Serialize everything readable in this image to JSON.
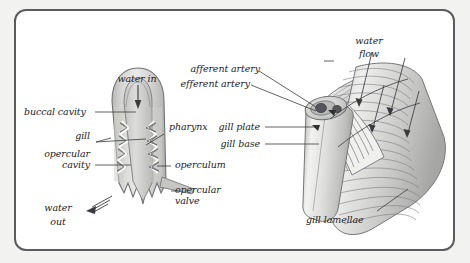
{
  "figure": {
    "background_color": "#f2f2f0",
    "panel_color": "#ffffff",
    "border_color": "#595b5e",
    "label_color": "#222326",
    "tissue_fill_light": "#e3e3e1",
    "tissue_fill_mid": "#c9c9c7",
    "tissue_fill_dark": "#a9a9a7",
    "outline_color": "#6b6d70"
  },
  "left_diagram": {
    "name": "fish-head-cross-section",
    "labels": {
      "water_in": "water in",
      "buccal_cavity": "buccal cavity",
      "pharynx": "pharynx",
      "gill": "gill",
      "opercular_cavity": "opercular\ncavity",
      "opercular_cavity_line1": "opercular",
      "opercular_cavity_line2": "cavity",
      "operculum": "operculum",
      "opercular_valve_line1": "opercular",
      "opercular_valve_line2": "valve",
      "water_out_line1": "water",
      "water_out_line2": "out"
    }
  },
  "right_diagram": {
    "name": "gill-arch-detail",
    "labels": {
      "water_flow_line1": "water",
      "water_flow_line2": "flow",
      "afferent_artery": "afferent artery",
      "efferent_artery": "efferent artery",
      "gill_plate": "gill plate",
      "gill_base": "gill base",
      "gill_lamellae": "gill lamellae"
    }
  },
  "icons": {
    "water_in_arrow": "down-arrow-icon",
    "water_out_arrow": "left-arrow-icon",
    "water_flow_arrows": "flow-arrow-icon",
    "artery_arrows": "artery-arrow-icon"
  }
}
